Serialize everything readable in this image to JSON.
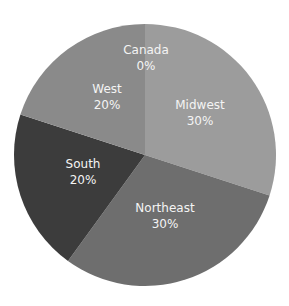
{
  "chart_data": {
    "type": "pie",
    "title": "",
    "categories": [
      "Midwest",
      "Northeast",
      "South",
      "West",
      "Canada"
    ],
    "values": [
      30,
      30,
      20,
      20,
      0
    ],
    "labels": [
      "Midwest\n30%",
      "Northeast\n30%",
      "South\n20%",
      "West\n20%",
      "Canada\n0%"
    ],
    "colors": [
      "#9c9c9c",
      "#6e6e6e",
      "#3c3c3c",
      "#8a8a8a",
      "#8a8a8a"
    ],
    "start_angle_deg": 0,
    "direction": "clockwise",
    "legend": "none",
    "center": [
      145,
      155
    ],
    "radius": 131
  },
  "slices": [
    {
      "name": "Midwest",
      "pct": "30%",
      "value": 30,
      "color": "#9c9c9c",
      "label_pos": [
        200,
        109
      ]
    },
    {
      "name": "Northeast",
      "pct": "30%",
      "value": 30,
      "color": "#6e6e6e",
      "label_pos": [
        165,
        212
      ]
    },
    {
      "name": "South",
      "pct": "20%",
      "value": 20,
      "color": "#3c3c3c",
      "label_pos": [
        83,
        168
      ]
    },
    {
      "name": "West",
      "pct": "20%",
      "value": 20,
      "color": "#8a8a8a",
      "label_pos": [
        107,
        93
      ]
    },
    {
      "name": "Canada",
      "pct": "0%",
      "value": 0,
      "color": "#8a8a8a",
      "label_pos": [
        146,
        54
      ]
    }
  ]
}
